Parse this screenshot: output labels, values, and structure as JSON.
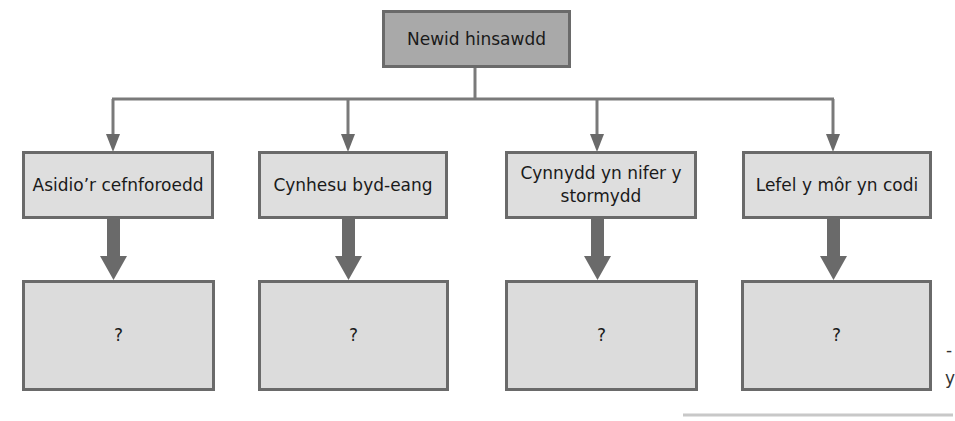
{
  "diagram": {
    "root": {
      "label": "Newid hinsawdd"
    },
    "effects": [
      {
        "label": "Asidio’r cefnforoedd",
        "answer": "?"
      },
      {
        "label": "Cynhesu byd-eang",
        "answer": "?"
      },
      {
        "label": "Cynnydd yn nifer y stormydd",
        "answer": "?"
      },
      {
        "label": "Lefel y môr yn codi",
        "answer": "?"
      }
    ],
    "colors": {
      "root_fill": "#a9a9a9",
      "box_fill": "#dedede",
      "border": "#6a6a6a",
      "connector": "#7a7a7a"
    },
    "edge_fragments": [
      "-",
      "y"
    ]
  }
}
